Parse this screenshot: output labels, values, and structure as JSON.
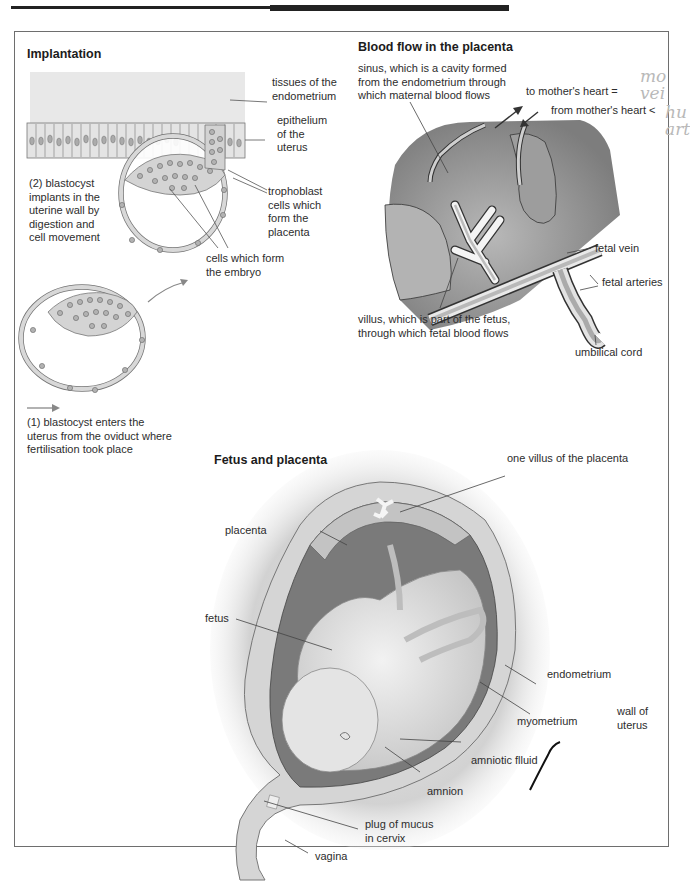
{
  "page": {
    "header_rule": "decorative top rule"
  },
  "panels": {
    "implantation": {
      "title": "Implantation",
      "labels": {
        "endometrium_tissue": "tissues of the\nendometrium",
        "epithelium": "epithelium\nof the\nuterus",
        "step2": "(2) blastocyst\nimplants in the\nuterine wall by\ndigestion and\ncell movement",
        "trophoblast": "trophoblast\ncells which\nform the\nplacenta",
        "embryo_cells": "cells which form\nthe embryo",
        "step1": "(1) blastocyst enters the\nuterus from the oviduct where\nfertilisation took place"
      }
    },
    "blood_flow": {
      "title": "Blood flow in the placenta",
      "labels": {
        "sinus": "sinus, which is a cavity formed\nfrom the endometrium through\nwhich maternal blood flows",
        "to_heart": "to mother's heart =",
        "from_heart": "from mother's heart <",
        "fetal_vein": "fetal vein",
        "fetal_arteries": "fetal arteries",
        "villus": "villus, which is part of the fetus,\nthrough which fetal blood flows",
        "umbilical_cord": "umbilical cord"
      },
      "handwritten_notes": {
        "note1": "mo\n vei",
        "note2": "hu\nart"
      }
    },
    "fetus_placenta": {
      "title": "Fetus and placenta",
      "labels": {
        "one_villus": "one villus of the placenta",
        "placenta": "placenta",
        "fetus": "fetus",
        "endometrium": "endometrium",
        "myometrium": "myometrium",
        "wall_of_uterus": "wall of\nuterus",
        "amniotic_fluid": "amniotic flluid",
        "amnion": "amnion",
        "plug_of_mucus": "plug of mucus\nin cervix",
        "vagina": "vagina"
      }
    }
  },
  "colors": {
    "frame": "#6e6e6e",
    "tissue": "#e6e6e6",
    "cell_fill": "#d9d9d9",
    "nucleus": "#a9a9a9",
    "sinus_dark": "#8e8e8e",
    "vessel_light": "#c9c9c9",
    "leader_line": "#4a4a4a"
  }
}
